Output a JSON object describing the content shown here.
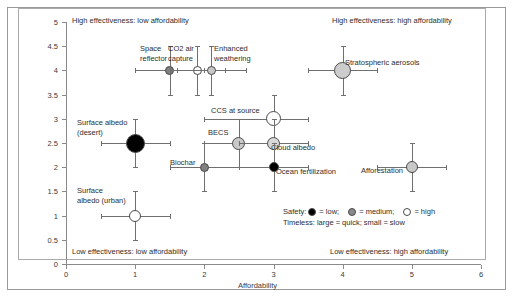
{
  "chart_data": {
    "type": "scatter",
    "title": "",
    "xlabel": "Affordability",
    "ylabel": "Effectiveness",
    "xlim": [
      0,
      6
    ],
    "ylim": [
      0,
      5
    ],
    "xticks": [
      "0",
      "1",
      "2",
      "3",
      "4",
      "5",
      "6"
    ],
    "yticks": [
      "0",
      "0.5",
      "1",
      "1.5",
      "2",
      "2.5",
      "3",
      "3.5",
      "4",
      "4.5",
      "5"
    ],
    "grid": false,
    "legend_position": "inside-bottom-right",
    "quadrant_labels": {
      "top_left": "High effectiveness: low affordability",
      "top_right": "High effectiveness: high affordability",
      "bottom_left": "Low effectiveness: low affordability",
      "bottom_right": "Low effectiveness: high affordability"
    },
    "legend": {
      "safety_prefix": "Safety:",
      "low_label": "= low;",
      "medium_label": "= medium;",
      "high_label": "= high",
      "timeless_line": "Timeless: large = quick; small = slow"
    },
    "encoding": {
      "color_means": "safety",
      "size_means": "timeliness",
      "low_color": "#000000",
      "medium_color": "#808080",
      "high_color": "#ffffff",
      "light_medium_color": "#c8c8c8"
    },
    "points": [
      {
        "label": "Space reflector",
        "label_text": "Space\nreflector",
        "x": 1.5,
        "y": 4.0,
        "xerr_low": 0.5,
        "xerr_high": 0.5,
        "yerr_low": 0.5,
        "yerr_high": 0.5,
        "safety": "medium",
        "size": 9,
        "color": "#808080",
        "label_x": 140,
        "label_y": 44
      },
      {
        "label": "CO2 air capture",
        "label_text": "CO2 air\ncapture",
        "x": 1.9,
        "y": 4.0,
        "xerr_low": 0.4,
        "xerr_high": 0.4,
        "yerr_low": 0.5,
        "yerr_high": 0.5,
        "safety": "high",
        "size": 9,
        "color": "#ffffff",
        "label_x": 168,
        "label_y": 44
      },
      {
        "label": "Enhanced weathering",
        "label_text": "Enhanced\nweathering",
        "x": 2.1,
        "y": 4.0,
        "xerr_low": 0.5,
        "xerr_high": 0.5,
        "yerr_low": 0.5,
        "yerr_high": 0.5,
        "safety": "medium",
        "size": 9,
        "color": "#c8c8c8",
        "label_x": 214,
        "label_y": 44
      },
      {
        "label": "Stratospheric aerosols",
        "label_text": "Stratospheric aerosols",
        "x": 4.0,
        "y": 4.0,
        "xerr_low": 0.5,
        "xerr_high": 0.5,
        "yerr_low": 0.5,
        "yerr_high": 0.5,
        "safety": "medium",
        "size": 17,
        "color": "#cccccc",
        "label_x": 345,
        "label_y": 58
      },
      {
        "label": "CCS at source",
        "label_text": "CCS at source",
        "x": 3.0,
        "y": 3.0,
        "xerr_low": 1.0,
        "xerr_high": 0.5,
        "yerr_low": 0.5,
        "yerr_high": 0.5,
        "safety": "high",
        "size": 15,
        "color": "#ffffff",
        "label_x": 211,
        "label_y": 106
      },
      {
        "label": "Surface albedo (desert)",
        "label_text": "Surface albedo\n(desert)",
        "x": 1.0,
        "y": 2.5,
        "xerr_low": 0.5,
        "xerr_high": 0.5,
        "yerr_low": 0.5,
        "yerr_high": 0.5,
        "safety": "low",
        "size": 19,
        "color": "#000000",
        "label_x": 77,
        "label_y": 118
      },
      {
        "label": "BECS",
        "label_text": "BECS",
        "x": 2.5,
        "y": 2.5,
        "xerr_low": 0.5,
        "xerr_high": 0.5,
        "yerr_low": 0.5,
        "yerr_high": 0.5,
        "safety": "medium",
        "size": 13,
        "color": "#c8c8c8",
        "label_x": 208,
        "label_y": 128
      },
      {
        "label": "Cloud albedo",
        "label_text": "Cloud albedo",
        "x": 3.0,
        "y": 2.5,
        "xerr_low": 0.5,
        "xerr_high": 0.5,
        "yerr_low": 0.5,
        "yerr_high": 0.5,
        "safety": "medium",
        "size": 13,
        "color": "#d8d8d8",
        "label_x": 271,
        "label_y": 143
      },
      {
        "label": "Biochar",
        "label_text": "Biochar",
        "x": 2.0,
        "y": 2.0,
        "xerr_low": 0.5,
        "xerr_high": 0.5,
        "yerr_low": 0.5,
        "yerr_high": 0.5,
        "safety": "medium",
        "size": 9,
        "color": "#808080",
        "label_x": 170,
        "label_y": 158
      },
      {
        "label": "Ocean fertilization",
        "label_text": "Ocean fertilization",
        "x": 3.0,
        "y": 2.0,
        "xerr_low": 0.5,
        "xerr_high": 0.5,
        "yerr_low": 0.5,
        "yerr_high": 0.5,
        "safety": "low",
        "size": 10,
        "color": "#000000",
        "label_x": 276,
        "label_y": 167
      },
      {
        "label": "Afforestation",
        "label_text": "Afforestation",
        "x": 5.0,
        "y": 2.0,
        "xerr_low": 0.5,
        "xerr_high": 0.5,
        "yerr_low": 0.5,
        "yerr_high": 0.5,
        "safety": "medium",
        "size": 12,
        "color": "#c8c8c8",
        "label_x": 361,
        "label_y": 166
      },
      {
        "label": "Surface albedo (urban)",
        "label_text": "Surface\nalbedo (urban)",
        "x": 1.0,
        "y": 1.0,
        "xerr_low": 0.5,
        "xerr_high": 0.5,
        "yerr_low": 0.5,
        "yerr_high": 0.5,
        "safety": "high",
        "size": 12,
        "color": "#ffffff",
        "label_x": 77,
        "label_y": 186
      }
    ]
  }
}
